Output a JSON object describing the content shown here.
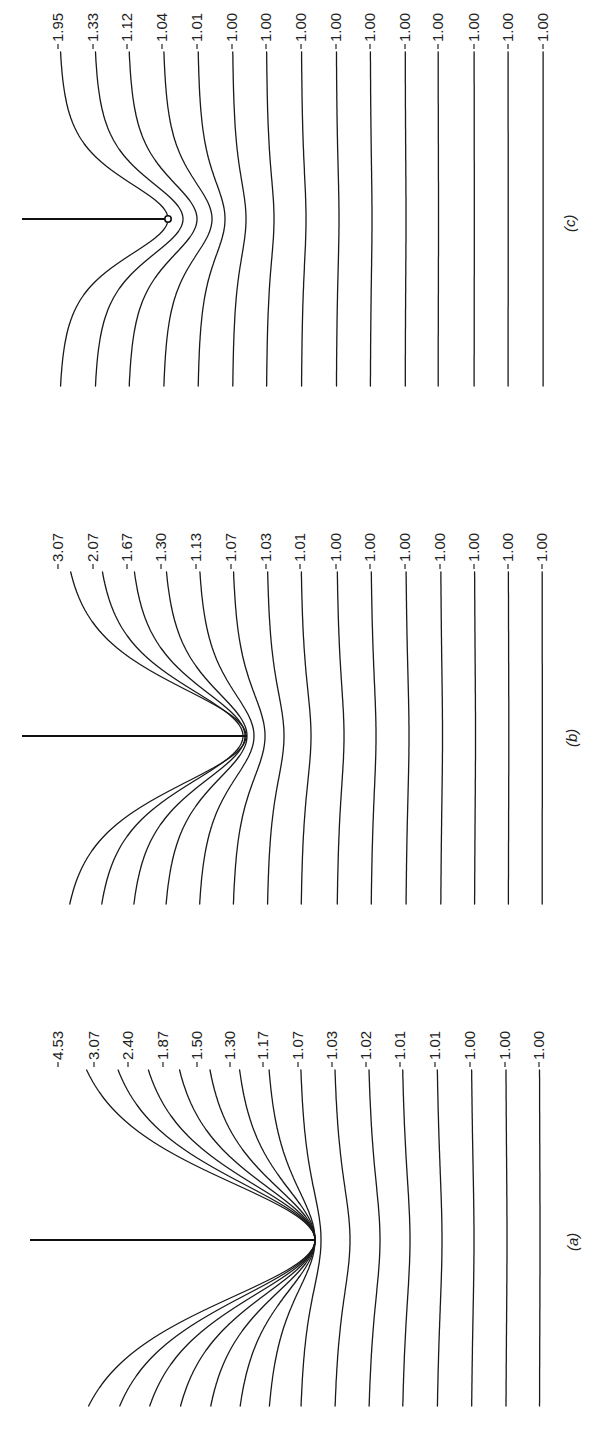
{
  "figure": {
    "panels": [
      {
        "id": "c",
        "label": "(c)",
        "labelPos": [
          575,
          222
        ],
        "tip": [
          168,
          219
        ],
        "crackStart": 22,
        "tipCircle": true,
        "lineTop": 52,
        "lineBottom": 387,
        "valueLabelY": 44,
        "values": [
          "1.95",
          "1.33",
          "1.12",
          "1.04",
          "1.01",
          "1.00",
          "1.00",
          "1.00",
          "1.00",
          "1.00",
          "1.00",
          "1.00",
          "1.00",
          "1.00",
          "1.00"
        ],
        "xs": [
          58,
          93,
          127,
          162,
          197,
          232,
          266,
          301,
          336,
          370,
          405,
          438,
          474,
          508,
          543
        ],
        "depth": [
          110,
          90,
          70,
          50,
          28,
          14,
          8,
          5,
          3,
          2,
          1,
          0.5,
          0.3,
          0.2,
          0.1
        ]
      },
      {
        "id": "b",
        "label": "(b)",
        "labelPos": [
          577,
          737
        ],
        "tip": [
          247,
          736
        ],
        "crackStart": 22,
        "tipCircle": false,
        "lineTop": 572,
        "lineBottom": 905,
        "valueLabelY": 562,
        "values": [
          "3.07",
          "2.07",
          "1.67",
          "1.30",
          "1.13",
          "1.07",
          "1.03",
          "1.01",
          "1.00",
          "1.00",
          "1.00",
          "1.00",
          "1.00",
          "1.00",
          "1.00"
        ],
        "xs": [
          58,
          93,
          127,
          161,
          196,
          231,
          266,
          300,
          336,
          370,
          405,
          440,
          474,
          508,
          542
        ],
        "depth": [
          188,
          150,
          118,
          86,
          58,
          34,
          18,
          11,
          8,
          6,
          4,
          2.5,
          1.5,
          0.8,
          0.3
        ]
      },
      {
        "id": "a",
        "label": "(a)",
        "labelPos": [
          578,
          1241
        ],
        "tip": [
          315,
          1240
        ],
        "crackStart": 30,
        "tipCircle": false,
        "lineTop": 1070,
        "lineBottom": 1406,
        "valueLabelY": 1060,
        "values": [
          "4.53",
          "3.07",
          "2.40",
          "1.87",
          "1.50",
          "1.30",
          "1.17",
          "1.07",
          "1.03",
          "1.02",
          "1.01",
          "1.01",
          "1.00",
          "1.00",
          "1.00"
        ],
        "xs": [
          58,
          94,
          128,
          163,
          197,
          230,
          263,
          298,
          332,
          366,
          400,
          435,
          470,
          505,
          539
        ],
        "depth": [
          257,
          221,
          187,
          152,
          118,
          85,
          52,
          23,
          18,
          14,
          10,
          7,
          4,
          2,
          1
        ]
      }
    ]
  }
}
